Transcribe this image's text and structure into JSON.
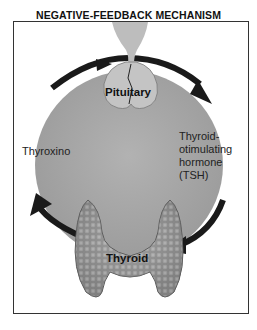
{
  "diagram": {
    "title": "NEGATIVE-FEEDBACK MECHANISM",
    "nodes": {
      "pituitary": "Pituitary",
      "thyroid": "Thyroid"
    },
    "edges": {
      "thyroxine": "Thyroxino",
      "tsh_line1": "Thyroid-",
      "tsh_line2": "otimulating",
      "tsh_line3": "hormone",
      "tsh_line4": "(TSH)"
    },
    "colors": {
      "circle_fill": "#a8a8a8",
      "arrow": "#1a1a1a",
      "gland": "#8a8a8a",
      "frame": "#333333"
    }
  }
}
